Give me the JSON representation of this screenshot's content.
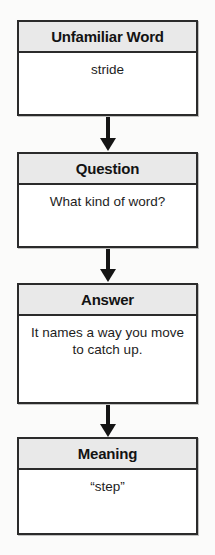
{
  "diagram": {
    "type": "vertical-flowchart",
    "background_color": "#fbfbfa",
    "border_color": "#2b2b2b",
    "header_background_color": "#e9e9e9",
    "body_background_color": "#ffffff",
    "text_color": "#131313",
    "arrow_color": "#151515",
    "nodes": [
      {
        "header": "Unfamiliar Word",
        "body": "stride"
      },
      {
        "header": "Question",
        "body": "What kind of word?"
      },
      {
        "header": "Answer",
        "body": "It names a way you move to catch up."
      },
      {
        "header": "Meaning",
        "body": "“step”"
      }
    ],
    "connectors": [
      {
        "name": "arrow-down",
        "from": "Unfamiliar Word",
        "to": "Question"
      },
      {
        "name": "arrow-down",
        "from": "Question",
        "to": "Answer"
      },
      {
        "name": "arrow-down",
        "from": "Answer",
        "to": "Meaning"
      }
    ]
  }
}
